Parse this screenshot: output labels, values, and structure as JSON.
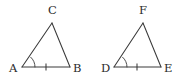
{
  "figure": {
    "background_color": "#ffffff",
    "stroke_color": "#3a3a3a",
    "label_color": "#2b2b2b",
    "width": 190,
    "height": 84
  },
  "triangles": [
    {
      "name": "triangle-abc",
      "vertices": [
        {
          "label": "A",
          "x": 22,
          "y": 67,
          "label_x": 9,
          "label_y": 72,
          "marks": {
            "angle_arcs": 1
          }
        },
        {
          "label": "B",
          "x": 70,
          "y": 67,
          "label_x": 73,
          "label_y": 72,
          "marks": {
            "angle_arcs": 0
          }
        },
        {
          "label": "C",
          "x": 52,
          "y": 23,
          "label_x": 48,
          "label_y": 14,
          "marks": {
            "angle_arcs": 0
          }
        }
      ],
      "sides": [
        {
          "name": "side-ab",
          "from": "A",
          "to": "B",
          "tick_marks": 1,
          "tick_x": 46,
          "tick_y": 67
        },
        {
          "name": "side-bc",
          "from": "B",
          "to": "C",
          "tick_marks": 0
        },
        {
          "name": "side-ca",
          "from": "C",
          "to": "A",
          "tick_marks": 0
        }
      ]
    },
    {
      "name": "triangle-def",
      "vertices": [
        {
          "label": "D",
          "x": 114,
          "y": 67,
          "label_x": 101,
          "label_y": 72,
          "marks": {
            "angle_arcs": 1
          }
        },
        {
          "label": "E",
          "x": 161,
          "y": 67,
          "label_x": 164,
          "label_y": 72,
          "marks": {
            "angle_arcs": 0
          }
        },
        {
          "label": "F",
          "x": 143,
          "y": 23,
          "label_x": 139,
          "label_y": 14,
          "marks": {
            "angle_arcs": 0
          }
        }
      ],
      "sides": [
        {
          "name": "side-de",
          "from": "D",
          "to": "E",
          "tick_marks": 1,
          "tick_x": 137,
          "tick_y": 67
        },
        {
          "name": "side-ef",
          "from": "E",
          "to": "F",
          "tick_marks": 0
        },
        {
          "name": "side-fd",
          "from": "F",
          "to": "D",
          "tick_marks": 0
        }
      ]
    }
  ]
}
